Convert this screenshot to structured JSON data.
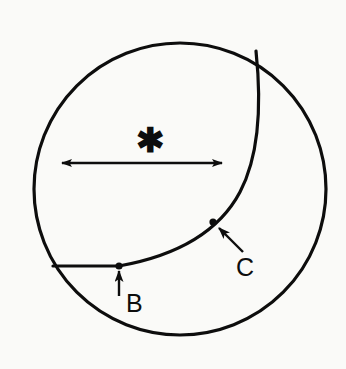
{
  "figure": {
    "type": "line-drawing",
    "background_color": "#fafaf8",
    "ink_color": "#0d0d0d",
    "canvas": {
      "width": 346,
      "height": 369
    }
  },
  "shapes": {
    "outer_circle": {
      "name": "outer-circle",
      "center_x": 180,
      "center_y": 189,
      "radius": 146,
      "stroke_width": 3.2,
      "filled": false
    },
    "inner_curve": {
      "name": "inner-crescent-curve",
      "description": "Curve from top of circle descending and bending left to meet horizontal line near point B",
      "path": "M 256 51 C 262 108, 259 156, 240 192 C 222 226, 186 254, 119 266",
      "stroke_width": 3.2
    },
    "horizontal_chord": {
      "name": "horizontal-chord-line",
      "x1": 53,
      "y1": 266,
      "x2": 119,
      "y2": 266,
      "stroke_width": 3.2
    }
  },
  "annotations": {
    "dimension_arrow": {
      "name": "dimension-double-arrow",
      "x1": 62,
      "y1": 163,
      "x2": 222,
      "y2": 163,
      "double_headed": true,
      "stroke_width": 2.4
    },
    "asterisk": {
      "name": "asterisk-marker",
      "glyph": "✱",
      "x": 150,
      "y": 152,
      "label": "*"
    },
    "point_b": {
      "name": "point-b",
      "label": "B",
      "dot_x": 119,
      "dot_y": 266,
      "dot_radius": 3.6,
      "arrow_from_x": 119,
      "arrow_from_y": 296,
      "arrow_to_x": 119,
      "arrow_to_y": 271,
      "label_x": 126,
      "label_y": 312
    },
    "point_c": {
      "name": "point-c",
      "label": "C",
      "dot_x": 213,
      "dot_y": 222,
      "dot_radius": 3.6,
      "arrow_from_x": 243,
      "arrow_from_y": 252,
      "arrow_to_x": 219,
      "arrow_to_y": 228,
      "label_x": 236,
      "label_y": 276
    }
  }
}
